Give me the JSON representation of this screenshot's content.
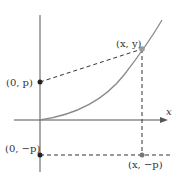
{
  "diagram": {
    "title": "",
    "axes": {
      "x_label": "x",
      "color": "#555555"
    },
    "curve": {
      "description": "parabola through origin",
      "color": "#8a8a8a"
    },
    "points": [
      {
        "id": "xy",
        "label": "(x, y)",
        "color": "#9a9a9a"
      },
      {
        "id": "0p",
        "label": "(0, p)",
        "color": "#222222"
      },
      {
        "id": "0mp",
        "label": "(0, −p)",
        "color": "#222222"
      },
      {
        "id": "xmp",
        "label": "(x, −p)",
        "color": "#777777"
      }
    ],
    "dashed_color": "#333333"
  }
}
